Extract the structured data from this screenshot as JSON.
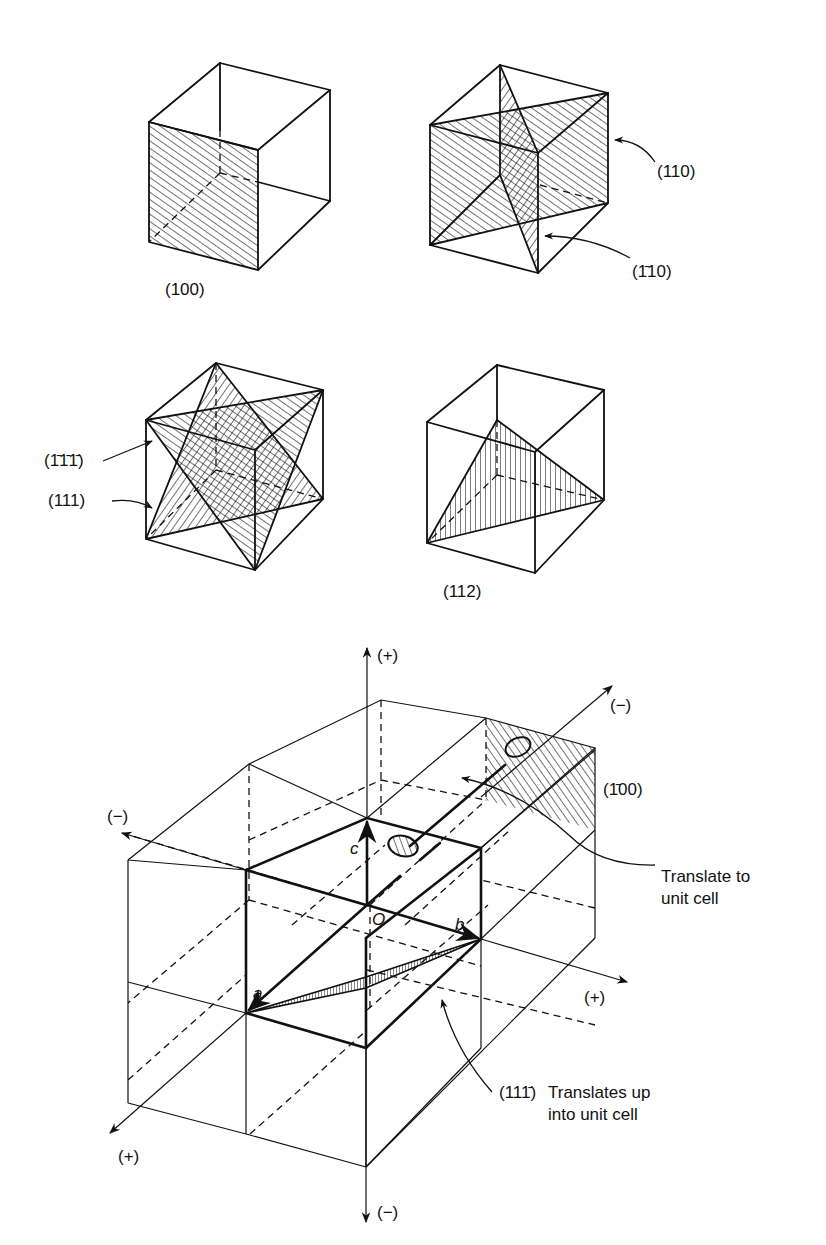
{
  "figure": {
    "panels": [
      {
        "id": "cube-100",
        "plane": "(100)",
        "label": "(100)"
      },
      {
        "id": "cube-110",
        "planes": [
          "(110)",
          "(1̄10)"
        ],
        "labels": [
          "(110)",
          "(1̄10)"
        ]
      },
      {
        "id": "cube-111",
        "planes": [
          "(1̄1̄1̄)",
          "(111)"
        ],
        "labels": [
          "(1̄1̄1̄)",
          "(111)"
        ]
      },
      {
        "id": "cube-112",
        "plane": "(112)",
        "label": "(112)"
      }
    ],
    "lattice": {
      "axes": {
        "c_positive": "(+)",
        "c_negative": "(−)",
        "b_positive": "(+)",
        "b_negative": "(−)",
        "a_positive": "(+)",
        "a_negative": "(−)"
      },
      "vectors": {
        "a": "a",
        "b": "b",
        "c": "c",
        "origin": "O"
      },
      "planes": {
        "p100bar": "(1̄00)",
        "p111bar": "(111̄)"
      },
      "annotations": {
        "translate_1": "Translate to",
        "translate_2": "unit cell",
        "translates_up_1": "Translates up",
        "translates_up_2": "into unit cell"
      }
    }
  }
}
